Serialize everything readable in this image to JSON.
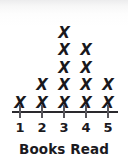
{
  "chart_data": {
    "type": "bar",
    "plot_style": "line-plot-x-marks",
    "title": "Books Read",
    "xlabel": "",
    "ylabel": "",
    "categories": [
      "1",
      "2",
      "3",
      "4",
      "5"
    ],
    "values": [
      1,
      2,
      5,
      4,
      2
    ],
    "mark_glyph": "X",
    "total_marks": 14,
    "ylim": [
      0,
      5
    ],
    "grid": false,
    "legend": null,
    "axis": {
      "tick_labels": [
        "1",
        "2",
        "3",
        "4",
        "5"
      ],
      "line_color": "#2a292d",
      "tick_color": "#57565c"
    },
    "colors": {
      "mark": "#19181c",
      "text": "#1b1a1e",
      "background": "#ffffff"
    }
  },
  "plot": {
    "title": "Books Read",
    "columns": [
      {
        "label": "1",
        "count": 1,
        "x": 20
      },
      {
        "label": "2",
        "count": 2,
        "x": 42
      },
      {
        "label": "3",
        "count": 5,
        "x": 64
      },
      {
        "label": "4",
        "count": 4,
        "x": 86
      },
      {
        "label": "5",
        "count": 2,
        "x": 108
      }
    ]
  }
}
